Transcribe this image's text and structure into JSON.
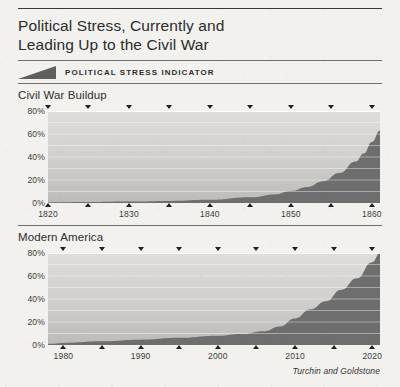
{
  "figure": {
    "title": "Political Stress, Currently and Leading Up to the Civil War",
    "title_line1": "Political Stress, Currently and",
    "title_line2": "Leading Up to the Civil War",
    "legend_label": "POLITICAL STRESS INDICATOR",
    "source": "Turchin and Goldstone",
    "colors": {
      "paper": "#f2f1ed",
      "fill_dark": "#6e6e6e",
      "plot_background": "#c9c9c7",
      "gridline": "#ffffff",
      "rule": "#3a3a3a",
      "text": "#2c2c2c"
    }
  },
  "chart_data": [
    {
      "type": "area",
      "title": "Civil War Buildup",
      "xlabel": "",
      "ylabel": "",
      "xlim": [
        1820,
        1861
      ],
      "ylim": [
        0,
        80
      ],
      "grid": true,
      "legend": "POLITICAL STRESS INDICATOR",
      "legend_position": "top",
      "ytick_labels": [
        "0%",
        "20%",
        "40%",
        "60%",
        "80%"
      ],
      "yticks": [
        0,
        20,
        40,
        60,
        80
      ],
      "xtick_labels": [
        "1820",
        "1830",
        "1840",
        "1850",
        "1860"
      ],
      "xticks": [
        1820,
        1830,
        1840,
        1850,
        1860
      ],
      "xminor_ticks": [
        1825,
        1835,
        1845,
        1855
      ],
      "x": [
        1820,
        1825,
        1830,
        1835,
        1840,
        1845,
        1848,
        1850,
        1852,
        1854,
        1856,
        1858,
        1859,
        1860,
        1861
      ],
      "values": [
        0.5,
        0.8,
        1.2,
        1.8,
        2.8,
        5.0,
        7.5,
        10.5,
        14.0,
        19.0,
        26.0,
        36.0,
        43.0,
        53.0,
        63.0
      ]
    },
    {
      "type": "area",
      "title": "Modern America",
      "xlabel": "",
      "ylabel": "",
      "xlim": [
        1978,
        2021
      ],
      "ylim": [
        0,
        80
      ],
      "grid": true,
      "legend": "POLITICAL STRESS INDICATOR",
      "legend_position": "top",
      "ytick_labels": [
        "0%",
        "20%",
        "40%",
        "60%",
        "80%"
      ],
      "yticks": [
        0,
        20,
        40,
        60,
        80
      ],
      "xtick_labels": [
        "1980",
        "1990",
        "2000",
        "2010",
        "2020"
      ],
      "xticks": [
        1980,
        1990,
        2000,
        2010,
        2020
      ],
      "xminor_ticks": [
        1985,
        1995,
        2005,
        2015
      ],
      "x": [
        1978,
        1980,
        1985,
        1990,
        1995,
        2000,
        2003,
        2006,
        2008,
        2010,
        2012,
        2014,
        2016,
        2018,
        2020,
        2021
      ],
      "values": [
        1.0,
        1.8,
        3.2,
        4.6,
        6.2,
        8.0,
        9.5,
        12.0,
        16.0,
        23.0,
        31.0,
        38.0,
        48.0,
        58.0,
        72.0,
        80.0
      ]
    }
  ]
}
